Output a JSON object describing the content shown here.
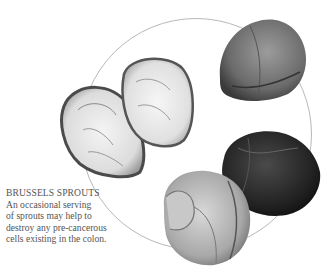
{
  "caption": {
    "title": "BRUSSELS SPROUTS",
    "lines": [
      "An occasional serving",
      "of sprouts may help to",
      "destroy any pre-cancerous",
      "cells existing in the colon."
    ]
  },
  "illustration": {
    "subject": "brussels-sprouts",
    "items": [
      "halved-sprout-left",
      "halved-sprout-right",
      "whole-sprout-top-right",
      "whole-sprout-dark",
      "whole-sprout-light"
    ],
    "ring_color": "#b8b8b8"
  }
}
